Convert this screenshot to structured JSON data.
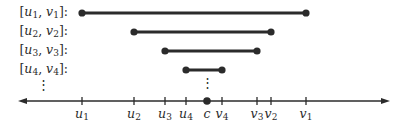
{
  "diagram": {
    "intervals": [
      {
        "label_var_u": "u",
        "label_var_v": "v",
        "index": "1",
        "u_x": 82,
        "v_x": 306,
        "y": 13
      },
      {
        "label_var_u": "u",
        "label_var_v": "v",
        "index": "2",
        "u_x": 134,
        "v_x": 271,
        "y": 32
      },
      {
        "label_var_u": "u",
        "label_var_v": "v",
        "index": "3",
        "u_x": 165,
        "v_x": 257,
        "y": 51
      },
      {
        "label_var_u": "u",
        "label_var_v": "v",
        "index": "4",
        "u_x": 186,
        "v_x": 222,
        "y": 70
      }
    ],
    "ellipsis_left": "⋮",
    "ellipsis_center": "⋮",
    "axis": {
      "y": 101,
      "x_start": 18,
      "x_end": 390,
      "ticks": [
        {
          "name": "u",
          "sub": "1",
          "x": 82
        },
        {
          "name": "u",
          "sub": "2",
          "x": 134
        },
        {
          "name": "u",
          "sub": "3",
          "x": 165
        },
        {
          "name": "u",
          "sub": "4",
          "x": 186
        },
        {
          "name": "c",
          "sub": "",
          "x": 207
        },
        {
          "name": "v",
          "sub": "4",
          "x": 222
        },
        {
          "name": "v",
          "sub": "3",
          "x": 257
        },
        {
          "name": "v",
          "sub": "2",
          "x": 271
        },
        {
          "name": "v",
          "sub": "1",
          "x": 306
        }
      ],
      "point_c_x": 207
    },
    "colors": {
      "line": "#2b2b2b",
      "text": "#2b2b2b"
    }
  }
}
